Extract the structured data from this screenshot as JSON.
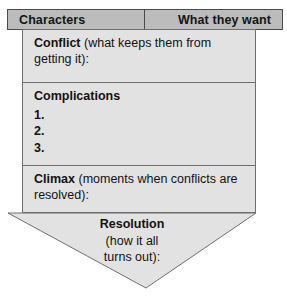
{
  "worksheet": {
    "title": "Story structure organizer",
    "header": {
      "left_label": "Characters",
      "right_label": "What they want"
    },
    "sections": [
      {
        "id": "conflict",
        "lead": "Conflict",
        "detail": " (what keeps them from getting it):"
      },
      {
        "id": "complications",
        "lead": "Complications",
        "detail": "",
        "items": [
          "1.",
          "2.",
          "3."
        ]
      },
      {
        "id": "climax",
        "lead": "Climax",
        "detail": " (moments when conflicts are resolved):"
      }
    ],
    "pennant": {
      "lead": "Resolution",
      "line2": "(how it all",
      "line3": "turns out):"
    },
    "colors": {
      "header_fill": "#bcbcbc",
      "header_border": "#4a4a4a",
      "body_fill": "#e2e2e2",
      "body_border": "#6f6f6f",
      "text": "#121212",
      "page_background": "#ffffff"
    }
  }
}
